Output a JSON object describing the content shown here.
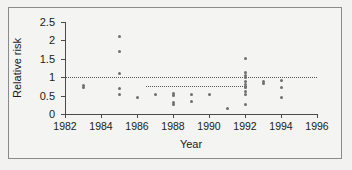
{
  "chart_data": {
    "type": "scatter",
    "title": "",
    "xlabel": "Year",
    "ylabel": "Relative risk",
    "xlim": [
      1982,
      1996
    ],
    "ylim": [
      0,
      2.5
    ],
    "xticks": [
      1982,
      1984,
      1986,
      1988,
      1990,
      1992,
      1994,
      1996
    ],
    "xtick_labels": [
      "1982",
      "1984",
      "1986",
      "1988",
      "1990",
      "1992",
      "1994",
      "1996"
    ],
    "yticks": [
      0,
      0.5,
      1,
      1.5,
      2,
      2.5
    ],
    "ytick_labels": [
      "0",
      "0.5",
      "1",
      "1.5",
      "2",
      "2.5"
    ],
    "grid": false,
    "legend": null,
    "marker_color": "#6f6f6f",
    "axis_color": "#4a4a4a",
    "reference_lines": [
      {
        "name": "null-effect-line",
        "y": 1.0,
        "x_start": 1982,
        "x_end": 1996,
        "style": "dotted"
      },
      {
        "name": "pooled-estimate-line",
        "y": 0.75,
        "x_start": 1986.5,
        "x_end": 1992.1,
        "style": "dotted"
      }
    ],
    "points": [
      {
        "x": 1983.0,
        "y": 0.78
      },
      {
        "x": 1983.0,
        "y": 0.71
      },
      {
        "x": 1985.0,
        "y": 2.1
      },
      {
        "x": 1985.0,
        "y": 1.7
      },
      {
        "x": 1985.0,
        "y": 1.1
      },
      {
        "x": 1985.0,
        "y": 0.7
      },
      {
        "x": 1985.0,
        "y": 0.52
      },
      {
        "x": 1986.0,
        "y": 0.44
      },
      {
        "x": 1987.0,
        "y": 0.52
      },
      {
        "x": 1988.0,
        "y": 0.56
      },
      {
        "x": 1988.0,
        "y": 0.49
      },
      {
        "x": 1988.0,
        "y": 0.32
      },
      {
        "x": 1988.0,
        "y": 0.26
      },
      {
        "x": 1989.0,
        "y": 0.52
      },
      {
        "x": 1989.0,
        "y": 0.35
      },
      {
        "x": 1990.0,
        "y": 0.53
      },
      {
        "x": 1991.0,
        "y": 0.16
      },
      {
        "x": 1992.0,
        "y": 1.52
      },
      {
        "x": 1992.0,
        "y": 1.12
      },
      {
        "x": 1992.0,
        "y": 1.05
      },
      {
        "x": 1992.0,
        "y": 0.98
      },
      {
        "x": 1992.0,
        "y": 0.88
      },
      {
        "x": 1992.0,
        "y": 0.8
      },
      {
        "x": 1992.0,
        "y": 0.72
      },
      {
        "x": 1992.0,
        "y": 0.62
      },
      {
        "x": 1992.0,
        "y": 0.52
      },
      {
        "x": 1992.0,
        "y": 0.25
      },
      {
        "x": 1993.0,
        "y": 0.88
      },
      {
        "x": 1993.0,
        "y": 0.83
      },
      {
        "x": 1994.0,
        "y": 0.92
      },
      {
        "x": 1994.0,
        "y": 0.73
      },
      {
        "x": 1994.0,
        "y": 0.45
      }
    ]
  }
}
